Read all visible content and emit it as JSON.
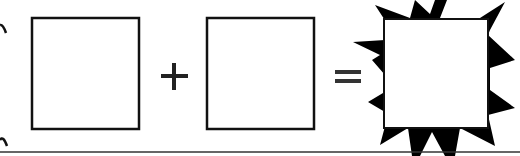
{
  "diagram": {
    "operands": [
      {
        "shape": "square",
        "fill": "#ffffff",
        "stroke": "#111111"
      },
      {
        "shape": "square",
        "fill": "#ffffff",
        "stroke": "#111111"
      }
    ],
    "operators": [
      "+",
      "="
    ],
    "result": {
      "shape": "square-with-starburst",
      "fill": "#ffffff",
      "burst_color": "#000000"
    },
    "baseline": {
      "color": "#333333"
    }
  }
}
